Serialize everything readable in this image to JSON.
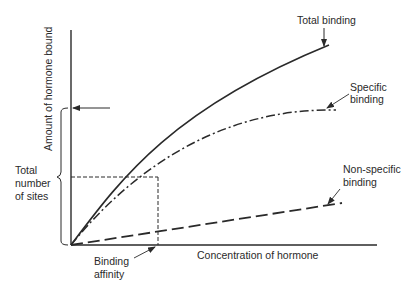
{
  "diagram": {
    "type": "hormone-receptor-binding-curve",
    "axes": {
      "y_label": "Amount of hormone bound",
      "x_label": "Concentration of hormone"
    },
    "curves": [
      {
        "name": "Total binding",
        "line_style": "solid"
      },
      {
        "name": "Specific binding",
        "line_style": "dash-dot"
      },
      {
        "name": "Non-specific binding",
        "line_style": "long-dash"
      }
    ],
    "annotations": {
      "total_binding": "Total binding",
      "specific_binding_line1": "Specific",
      "specific_binding_line2": "binding",
      "non_specific_line1": "Non-specific",
      "non_specific_line2": "binding",
      "total_sites_line1": "Total",
      "total_sites_line2": "number",
      "total_sites_line3": "of sites",
      "affinity_line1": "Binding",
      "affinity_line2": "affinity"
    },
    "colors": {
      "ink": "#2a2a2a",
      "background": "#ffffff"
    }
  }
}
